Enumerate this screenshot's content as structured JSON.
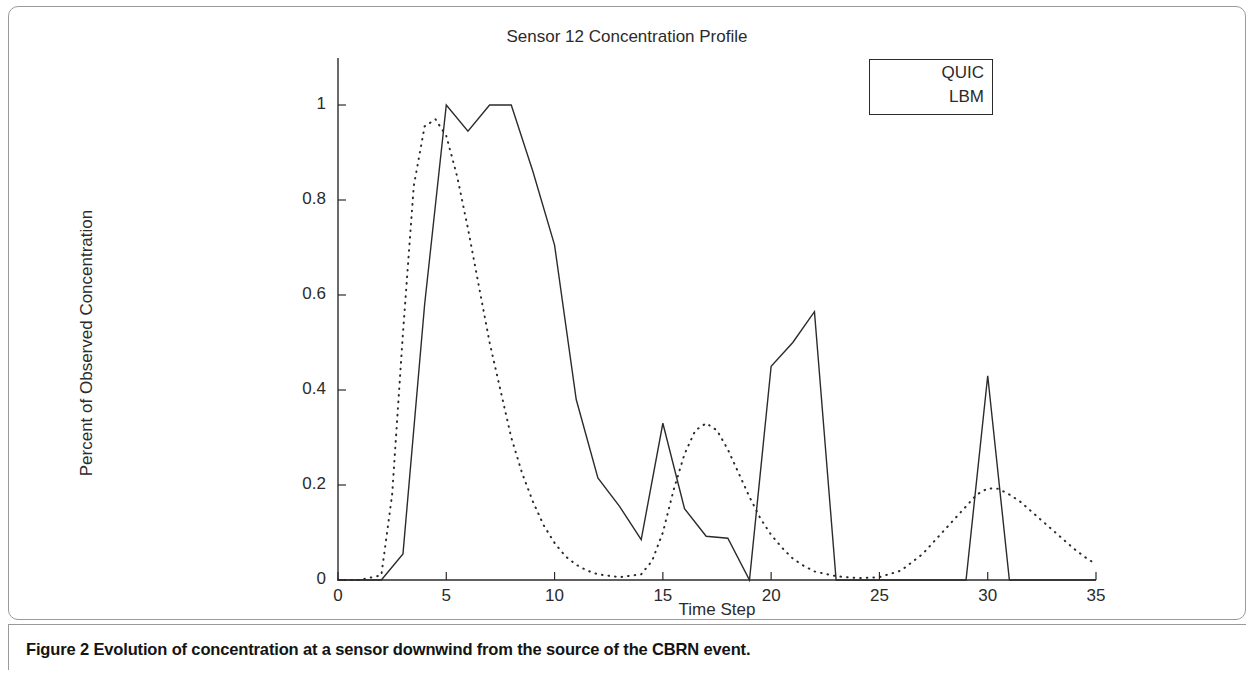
{
  "figure": {
    "caption_label": "Figure 2",
    "caption_text": "Evolution of concentration at a sensor downwind from the source of the CBRN event."
  },
  "chart_data": {
    "type": "line",
    "title": "Sensor 12 Concentration Profile",
    "xlabel": "Time Step",
    "ylabel": "Percent of Observed Concentration",
    "xlim": [
      0,
      35
    ],
    "ylim": [
      0,
      1.05
    ],
    "xticks": [
      0,
      5,
      10,
      15,
      20,
      25,
      30,
      35
    ],
    "xtick_labels": [
      "0",
      "5",
      "10",
      "15",
      "20",
      "25",
      "30",
      "35"
    ],
    "yticks": [
      0,
      0.2,
      0.4,
      0.6,
      0.8,
      1
    ],
    "ytick_labels": [
      "0",
      "0.2",
      "0.4",
      "0.6",
      "0.8",
      "1"
    ],
    "grid": false,
    "legend_position": "top-right",
    "legend_entries": [
      "QUIC",
      "LBM"
    ],
    "series": [
      {
        "name": "QUIC",
        "style": "solid",
        "color": "#2b2b2b",
        "x": [
          0,
          1,
          2,
          3,
          4,
          5,
          6,
          7,
          8,
          9,
          10,
          11,
          12,
          13,
          14,
          15,
          16,
          17,
          18,
          19,
          20,
          21,
          22,
          23,
          24,
          25,
          26,
          27,
          28,
          29,
          30,
          31,
          32,
          33,
          34,
          35
        ],
        "values": [
          0,
          0,
          0,
          0.055,
          0.58,
          1.0,
          0.945,
          1.0,
          1.0,
          0.86,
          0.705,
          0.38,
          0.215,
          0.155,
          0.085,
          0.33,
          0.15,
          0.092,
          0.088,
          0,
          0.45,
          0.5,
          0.565,
          0,
          0,
          0,
          0,
          0,
          0,
          0,
          0.43,
          0,
          0,
          0,
          0,
          0
        ]
      },
      {
        "name": "LBM",
        "style": "dotted",
        "color": "#2b2b2b",
        "x": [
          0,
          1,
          2,
          2.5,
          3,
          3.5,
          4,
          4.5,
          5,
          5.5,
          6,
          6.5,
          7,
          7.5,
          8,
          8.5,
          9,
          9.5,
          10,
          10.5,
          11,
          11.5,
          12,
          13,
          14,
          14.5,
          15,
          15.5,
          16,
          16.5,
          17,
          17.5,
          18,
          18.5,
          19,
          19.5,
          20,
          20.5,
          21,
          21.5,
          22,
          23,
          24,
          25,
          26,
          27,
          27.5,
          28,
          28.5,
          29,
          29.5,
          30,
          30.5,
          31,
          31.5,
          32,
          32.5,
          33,
          33.5,
          34,
          34.5,
          35
        ],
        "values": [
          0,
          0,
          0.01,
          0.18,
          0.52,
          0.83,
          0.955,
          0.97,
          0.935,
          0.85,
          0.74,
          0.62,
          0.5,
          0.4,
          0.3,
          0.225,
          0.165,
          0.115,
          0.078,
          0.05,
          0.032,
          0.02,
          0.012,
          0.006,
          0.012,
          0.04,
          0.1,
          0.19,
          0.265,
          0.315,
          0.33,
          0.315,
          0.275,
          0.225,
          0.175,
          0.13,
          0.095,
          0.068,
          0.045,
          0.03,
          0.018,
          0.008,
          0.004,
          0.006,
          0.02,
          0.055,
          0.08,
          0.105,
          0.13,
          0.155,
          0.18,
          0.193,
          0.192,
          0.18,
          0.165,
          0.145,
          0.125,
          0.105,
          0.085,
          0.065,
          0.048,
          0.033
        ]
      }
    ]
  }
}
